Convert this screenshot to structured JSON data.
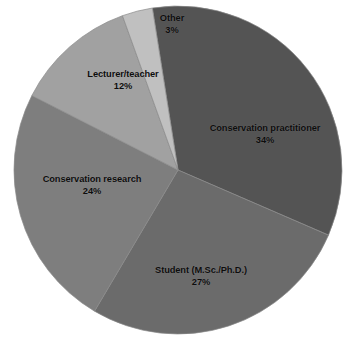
{
  "chart_data": {
    "type": "pie",
    "title": "",
    "xlabel": "",
    "ylabel": "",
    "grid": false,
    "legend_position": "none",
    "label_format": "name + percent, inside slice",
    "start_angle_deg": -9,
    "direction": "clockwise",
    "categories": [
      "Conservation practitioner",
      "Student (M.Sc./Ph.D.)",
      "Conservation research",
      "Lecturer/teacher",
      "Other"
    ],
    "values": [
      34,
      27,
      24,
      12,
      3
    ],
    "units": "%",
    "slices": [
      {
        "name": "Conservation practitioner",
        "value": 34,
        "percent_text": "34%",
        "color": "#545454",
        "label_x": 265,
        "label_y": 135
      },
      {
        "name": "Student (M.Sc./Ph.D.)",
        "value": 27,
        "percent_text": "27%",
        "color": "#6b6b6b",
        "label_x": 201,
        "label_y": 277
      },
      {
        "name": "Conservation research",
        "value": 24,
        "percent_text": "24%",
        "color": "#7e7e7e",
        "label_x": 92,
        "label_y": 186
      },
      {
        "name": "Lecturer/teacher",
        "value": 12,
        "percent_text": "12%",
        "color": "#a1a1a1",
        "label_x": 123,
        "label_y": 81
      },
      {
        "name": "Other",
        "value": 3,
        "percent_text": "3%",
        "color": "#c0c0c0",
        "label_x": 172,
        "label_y": 25
      }
    ],
    "geometry": {
      "center_x": 178,
      "center_y": 170,
      "radius": 164
    },
    "colors": {
      "background": "#ffffff",
      "label_text": "#0d0d0d",
      "slice_edge": "#8a8a8a"
    }
  },
  "caption": {
    "text": ""
  }
}
